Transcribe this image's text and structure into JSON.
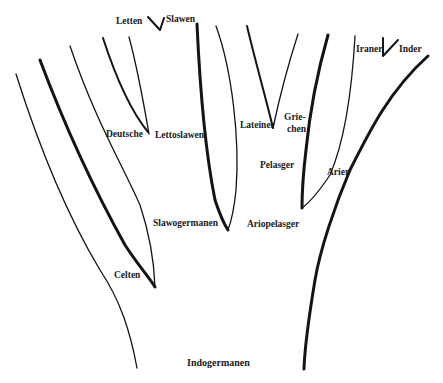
{
  "diagram": {
    "type": "tree",
    "root": "Indogermanen",
    "labels": {
      "indogermanen": "Indogermanen",
      "celten": "Celten",
      "slawogermanen": "Slawogermanen",
      "ariopelasger": "Ariopelasger",
      "deutsche": "Deutsche",
      "lettoslawen": "Lettoslawen",
      "letten": "Letten",
      "slawen": "Slawen",
      "lateiner": "Lateiner",
      "griechen_1": "Grie-",
      "griechen_2": "chen",
      "pelasger": "Pelasger",
      "arier": "Arier",
      "iraner": "Iraner",
      "inder": "Inder"
    },
    "nodes": [
      {
        "name": "Indogermanen",
        "children": [
          "Celten",
          "Slawogermanen",
          "Ariopelasger"
        ]
      },
      {
        "name": "Slawogermanen",
        "children": [
          "Deutsche",
          "Lettoslawen"
        ]
      },
      {
        "name": "Lettoslawen",
        "children": [
          "Letten",
          "Slawen"
        ]
      },
      {
        "name": "Ariopelasger",
        "children": [
          "Pelasger",
          "Arier"
        ]
      },
      {
        "name": "Pelasger",
        "children": [
          "Lateiner",
          "Griechen"
        ]
      },
      {
        "name": "Arier",
        "children": [
          "Iraner",
          "Inder"
        ]
      }
    ],
    "colors": {
      "line": "#141414",
      "background": "#ffffff"
    }
  }
}
